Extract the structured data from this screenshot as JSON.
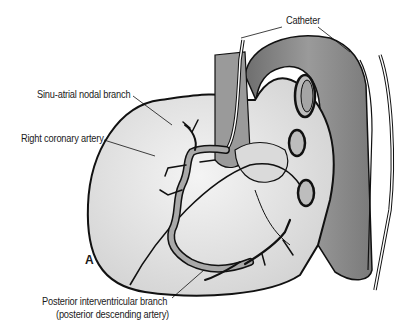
{
  "figure": {
    "panel_label": "A",
    "labels": {
      "catheter": "Catheter",
      "sinu_atrial": "Sinu-atrial nodal branch",
      "right_coronary": "Right coronary artery",
      "posterior_interventricular_line1": "Posterior interventricular branch",
      "posterior_interventricular_line2": "(posterior descending artery)"
    },
    "colors": {
      "outline": "#111111",
      "heart_fill": "#e4e4e4",
      "aorta_fill": "#8a8a8a",
      "artery_fill": "#a9a9a9",
      "background": "#ffffff"
    }
  }
}
